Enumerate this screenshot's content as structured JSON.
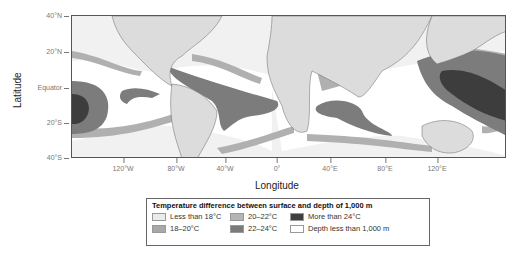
{
  "axes": {
    "ylabel": "Latitude",
    "xlabel": "Longitude",
    "yticks": [
      "40°N",
      "20°N",
      "Equator",
      "20°S",
      "40°S"
    ],
    "xticks": [
      "120°W",
      "80°W",
      "40°W",
      "0°",
      "40°E",
      "80°E",
      "120°E"
    ]
  },
  "legend": {
    "title": "Temperature difference between surface and depth of 1,000 m",
    "items": [
      {
        "label": "Less than 18°C",
        "color": "#ebebeb"
      },
      {
        "label": "20–22°C",
        "color": "#b5b5b5"
      },
      {
        "label": "More than 24°C",
        "color": "#3f3f3f"
      },
      {
        "label": "18–20°C",
        "color": "#a8a8a8"
      },
      {
        "label": "22–24°C",
        "color": "#7a7a7a"
      },
      {
        "label": "Depth less than 1,000 m",
        "color": "#ffffff"
      }
    ]
  },
  "colors": {
    "land": "#dcdcdc",
    "ocean_light": "#f1f1f1",
    "band_18_20": "#b0b0b0",
    "band_22_24": "#7c7c7c",
    "band_24": "#3d3d3d",
    "white_zone": "#ffffff"
  }
}
